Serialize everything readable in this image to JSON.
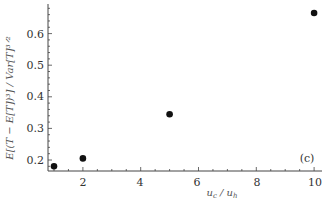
{
  "chart_data": {
    "type": "scatter",
    "title": "",
    "panel_label": "(c)",
    "xlabel": "u_c / u_h",
    "ylabel": "E[(T - E[T])^3] / Var[T]^{3/2}",
    "xlim": [
      0.8,
      10.2
    ],
    "ylim": [
      0.17,
      0.69
    ],
    "xticks": [
      2,
      4,
      6,
      8,
      10
    ],
    "yticks": [
      0.2,
      0.3,
      0.4,
      0.5,
      0.6
    ],
    "grid": false,
    "legend": null,
    "series": [
      {
        "name": "skewness",
        "x": [
          1,
          2,
          5,
          10
        ],
        "y": [
          0.18,
          0.205,
          0.345,
          0.665
        ]
      }
    ]
  },
  "labels": {
    "panel": "(c)",
    "x_axis_main": "u",
    "x_axis_sub1": "c",
    "x_axis_slash": " / ",
    "x_axis_main2": "u",
    "x_axis_sub2": "h",
    "y_axis": "E[(T − E[T])³] / Var[T]³ᐟ²",
    "xtick_2": "2",
    "xtick_4": "4",
    "xtick_6": "6",
    "xtick_8": "8",
    "xtick_10": "10",
    "ytick_02": "0.2",
    "ytick_03": "0.3",
    "ytick_04": "0.4",
    "ytick_05": "0.5",
    "ytick_06": "0.6"
  }
}
